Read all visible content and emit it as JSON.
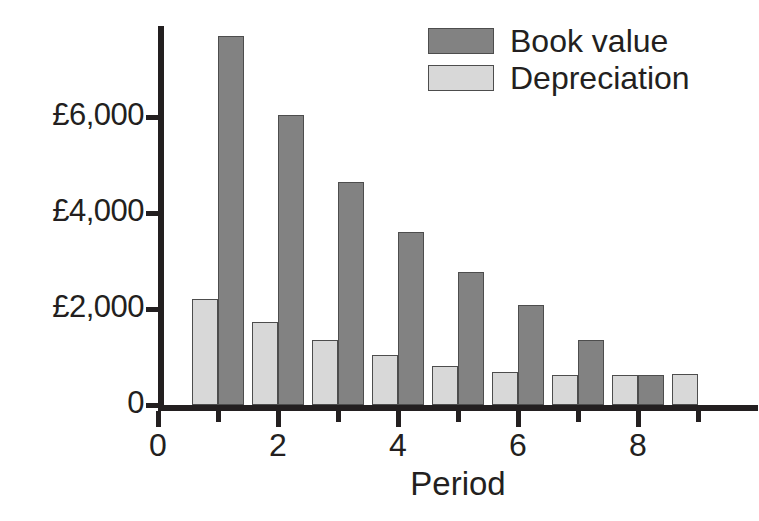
{
  "chart_data": {
    "type": "bar",
    "title": "",
    "subtitle": "",
    "xlabel": "Period",
    "ylabel": "",
    "grid": false,
    "legend_position": "top-right",
    "x": [
      1,
      2,
      3,
      4,
      5,
      6,
      7,
      8,
      9
    ],
    "categories": [
      "1",
      "2",
      "3",
      "4",
      "5",
      "6",
      "7",
      "8",
      "9"
    ],
    "xlim": [
      0,
      10
    ],
    "ylim": [
      0,
      7900
    ],
    "x_tick_labels": [
      "0",
      "2",
      "4",
      "6",
      "8"
    ],
    "x_tick_values": [
      0,
      2,
      4,
      6,
      8
    ],
    "x_minor_tick_values": [
      1,
      3,
      5,
      7,
      9
    ],
    "y_tick_labels": [
      "0",
      "£2,000",
      "£4,000",
      "£6,000"
    ],
    "y_tick_values": [
      0,
      2000,
      4000,
      6000
    ],
    "currency_symbol": "£",
    "series": [
      {
        "name": "Book value",
        "color": "#828282",
        "values": [
          7700,
          6050,
          4650,
          3600,
          2780,
          2080,
          1360,
          620,
          null
        ]
      },
      {
        "name": "Depreciation",
        "color": "#d8d8d8",
        "values": [
          2200,
          1720,
          1350,
          1050,
          820,
          680,
          630,
          620,
          640
        ]
      }
    ]
  },
  "legend": {
    "items": [
      {
        "label": "Book value",
        "swatch": "book"
      },
      {
        "label": "Depreciation",
        "swatch": "dep"
      }
    ]
  },
  "axes": {
    "x_title": "Period"
  },
  "colors": {
    "book_value": "#828282",
    "depreciation": "#d8d8d8",
    "axis": "#231f20",
    "bar_outline": "#4d4d4d",
    "background": "#ffffff"
  }
}
